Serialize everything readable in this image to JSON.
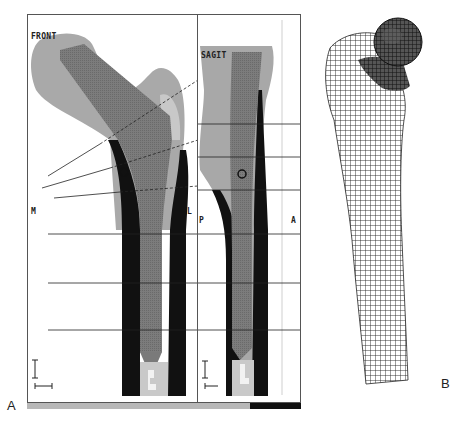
{
  "figure": {
    "panel_a": {
      "letter": "A",
      "frontal_view": {
        "label": "FRONT",
        "side_labels": {
          "medial": "M",
          "lateral": "L"
        }
      },
      "sagittal_view": {
        "label": "SAGIT",
        "side_labels": {
          "posterior": "P",
          "anterior": "A"
        }
      }
    },
    "panel_b": {
      "letter": "B",
      "description": "3D finite element mesh of proximal femur"
    },
    "colors": {
      "frame": "#555555",
      "cortical_bone": "#111111",
      "trabecular_fill": "#7a7a7a",
      "soft_bone": "#a8a8a8",
      "mesh_line": "#222222",
      "bottom_bar_grey": "#b8b8b8",
      "bottom_bar_black": "#111111"
    }
  }
}
